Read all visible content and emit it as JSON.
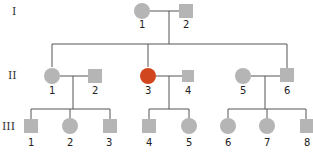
{
  "colors": {
    "unaffected": "#b5b5b5",
    "affected": "#d0471f",
    "line": "#555555"
  },
  "generations": [
    {
      "label": "I",
      "y": 11,
      "individuals": [
        {
          "id": "I-1",
          "number": "1",
          "sex": "female",
          "shape": "circle",
          "x": 142,
          "affected": false
        },
        {
          "id": "I-2",
          "number": "2",
          "sex": "male",
          "shape": "square",
          "x": 186,
          "affected": false
        }
      ]
    },
    {
      "label": "II",
      "y": 75,
      "individuals": [
        {
          "id": "II-1",
          "number": "1",
          "sex": "female",
          "shape": "circle",
          "x": 52,
          "affected": false
        },
        {
          "id": "II-2",
          "number": "2",
          "sex": "male",
          "shape": "square",
          "x": 95,
          "affected": false
        },
        {
          "id": "II-3",
          "number": "3",
          "sex": "female",
          "shape": "circle",
          "x": 148,
          "affected": true
        },
        {
          "id": "II-4",
          "number": "4",
          "sex": "male",
          "shape": "square",
          "x": 188,
          "affected": false
        },
        {
          "id": "II-5",
          "number": "5",
          "sex": "female",
          "shape": "circle",
          "x": 243,
          "affected": false
        },
        {
          "id": "II-6",
          "number": "6",
          "sex": "male",
          "shape": "square",
          "x": 286,
          "affected": false
        }
      ]
    },
    {
      "label": "III",
      "y": 126,
      "individuals": [
        {
          "id": "III-1",
          "number": "1",
          "sex": "male",
          "shape": "square",
          "x": 31,
          "affected": false
        },
        {
          "id": "III-2",
          "number": "2",
          "sex": "female",
          "shape": "circle",
          "x": 70,
          "affected": false
        },
        {
          "id": "III-3",
          "number": "3",
          "sex": "male",
          "shape": "square",
          "x": 109,
          "affected": false
        },
        {
          "id": "III-4",
          "number": "4",
          "sex": "male",
          "shape": "square",
          "x": 149,
          "affected": false
        },
        {
          "id": "III-5",
          "number": "5",
          "sex": "female",
          "shape": "circle",
          "x": 188,
          "affected": false
        },
        {
          "id": "III-6",
          "number": "6",
          "sex": "female",
          "shape": "circle",
          "x": 228,
          "affected": false
        },
        {
          "id": "III-7",
          "number": "7",
          "sex": "female",
          "shape": "circle",
          "x": 267,
          "affected": false
        },
        {
          "id": "III-8",
          "number": "8",
          "sex": "male",
          "shape": "square",
          "x": 306,
          "affected": false
        }
      ]
    }
  ],
  "matings": [
    {
      "partners": [
        "I-1",
        "I-2"
      ],
      "children": [
        "II-1",
        "II-3",
        "II-6"
      ]
    },
    {
      "partners": [
        "II-1",
        "II-2"
      ],
      "children": [
        "III-1",
        "III-2",
        "III-3"
      ]
    },
    {
      "partners": [
        "II-3",
        "II-4"
      ],
      "children": [
        "III-4",
        "III-5"
      ]
    },
    {
      "partners": [
        "II-5",
        "II-6"
      ],
      "children": [
        "III-6",
        "III-7",
        "III-8"
      ]
    }
  ]
}
